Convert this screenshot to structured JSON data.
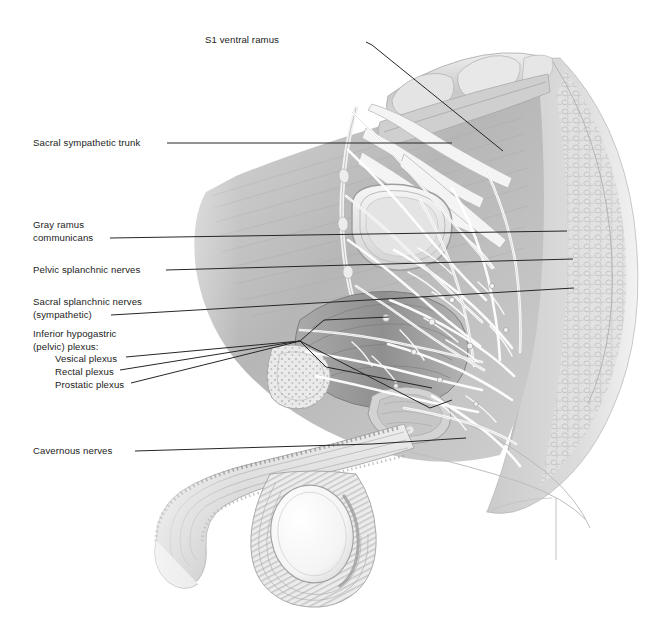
{
  "figure": {
    "view": "male pelvis, midsagittal, left lateral view",
    "style": "grayscale medical illustration, airbrush and line rendering",
    "background_color": "#ffffff",
    "ink_color": "#232323",
    "tissue_gray": "#b7b7b7",
    "label_font_size_px": 9.6
  },
  "labels": [
    {
      "id": "s1-ventral-ramus",
      "text": "S1 ventral ramus",
      "lines": [
        "S1 ventral ramus"
      ],
      "align": "right",
      "x": 279,
      "y": 34,
      "leader": {
        "type": "polyline",
        "points": "366,42 372,45 503,151"
      }
    },
    {
      "id": "sacral-sympathetic-trunk",
      "text": "Sacral sympathetic trunk",
      "lines": [
        "Sacral sympathetic trunk"
      ],
      "align": "left",
      "x": 33,
      "y": 137,
      "leader": {
        "type": "polyline",
        "points": "167,143 452,143"
      }
    },
    {
      "id": "gray-ramus-communicans",
      "text": "Gray ramus communicans",
      "lines": [
        "Gray ramus",
        "communicans"
      ],
      "align": "left",
      "x": 33,
      "y": 219,
      "leader": {
        "type": "polyline",
        "points": "110,238 567,231"
      }
    },
    {
      "id": "pelvic-splanchnic-nerves",
      "text": "Pelvic splanchnic nerves",
      "lines": [
        "Pelvic splanchnic nerves"
      ],
      "align": "left",
      "x": 33,
      "y": 264,
      "leader": {
        "type": "polyline",
        "points": "166,270 573,259"
      }
    },
    {
      "id": "sacral-splanchnic-nerves",
      "text": "Sacral splanchnic nerves (sympathetic)",
      "lines": [
        "Sacral splanchnic nerves",
        "(sympathetic)"
      ],
      "align": "left",
      "x": 33,
      "y": 296,
      "leader": {
        "type": "polyline",
        "points": "111,315 574,288"
      }
    },
    {
      "id": "inferior-hypogastric-plexus",
      "text": "Inferior hypogastric (pelvic) plexus:",
      "lines": [
        "Inferior hypogastric",
        "(pelvic) plexus:"
      ],
      "align": "left",
      "x": 33,
      "y": 328,
      "leader": null
    },
    {
      "id": "vesical-plexus",
      "text": "Vesical plexus",
      "lines": [
        "Vesical plexus"
      ],
      "align": "left",
      "x": 33,
      "y": 352,
      "leader": {
        "type": "polyline",
        "points": "126,357 300,341 324,320 389,317"
      }
    },
    {
      "id": "rectal-plexus",
      "text": "Rectal plexus",
      "lines": [
        "Rectal plexus"
      ],
      "align": "left",
      "x": 33,
      "y": 365,
      "leader": {
        "type": "polyline",
        "points": "120,370 300,341 326,367 432,388"
      }
    },
    {
      "id": "prostatic-plexus",
      "text": "Prostatic plexus",
      "lines": [
        "Prostatic plexus"
      ],
      "align": "left",
      "x": 33,
      "y": 378,
      "leader": {
        "type": "polyline",
        "points": "131,383 300,341 430,408 452,400"
      }
    },
    {
      "id": "cavernous-nerves",
      "text": "Cavernous nerves",
      "lines": [
        "Cavernous nerves"
      ],
      "align": "left",
      "x": 33,
      "y": 445,
      "leader": {
        "type": "polyline",
        "points": "135,451 372,444 466,438"
      }
    }
  ],
  "structures": [
    {
      "name": "sacrum",
      "note": "upper right, vertebral bodies and sacral canal"
    },
    {
      "name": "gluteal-fat-pad",
      "note": "stippled adipose tissue, far right margin"
    },
    {
      "name": "bladder",
      "note": "central, dome-shaped lumen outline"
    },
    {
      "name": "rectum",
      "note": "posterior, folded wall"
    },
    {
      "name": "prostate",
      "note": "inferior to bladder"
    },
    {
      "name": "penis-corpora",
      "note": "lower left, shaft in longitudinal section"
    },
    {
      "name": "testis-scrotum",
      "note": "lower center, oval testis in scrotal sac"
    },
    {
      "name": "pubic-symphysis",
      "note": "left anterior, cancellous bone texture"
    },
    {
      "name": "nerve-plexus-network",
      "note": "white branching nerve filaments over pelvic viscera"
    }
  ]
}
